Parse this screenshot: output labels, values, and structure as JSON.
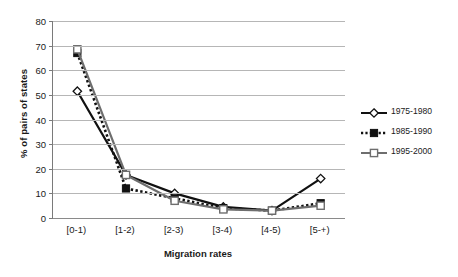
{
  "chart_data": {
    "type": "line",
    "title": "",
    "xlabel": "Migration rates",
    "ylabel": "% of pairs of states",
    "categories": [
      "[0-1)",
      "[1-2)",
      "[2-3)",
      "[3-4)",
      "[4-5)",
      "[5-+)"
    ],
    "ylim": [
      0,
      80
    ],
    "ytick_values": [
      0,
      10,
      20,
      30,
      40,
      50,
      60,
      70,
      80
    ],
    "ytick_labels": [
      "0",
      "10",
      "20",
      "30",
      "40",
      "50",
      "60",
      "70",
      "80"
    ],
    "grid": true,
    "legend_position": "right",
    "series": [
      {
        "name": "1975-1980",
        "values": [
          51.5,
          17.5,
          10.0,
          4.5,
          3.0,
          16.0
        ],
        "marker": "diamond-open",
        "line_style": "solid",
        "color": "#111111"
      },
      {
        "name": "1985-1990",
        "values": [
          67.0,
          12.0,
          8.0,
          4.0,
          3.0,
          6.0
        ],
        "marker": "square-filled",
        "line_style": "dotted",
        "color": "#111111"
      },
      {
        "name": "1995-2000",
        "values": [
          68.5,
          17.5,
          7.0,
          3.5,
          3.0,
          5.0
        ],
        "marker": "square-open",
        "line_style": "solid",
        "color": "#6e6e6e"
      }
    ]
  },
  "axes": {
    "y_title": "% of pairs of states",
    "x_title": "Migration rates"
  },
  "legend": {
    "items": [
      {
        "label": "1975-1980"
      },
      {
        "label": "1985-1990"
      },
      {
        "label": "1995-2000"
      }
    ]
  }
}
